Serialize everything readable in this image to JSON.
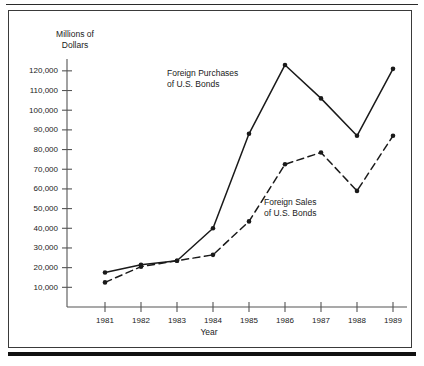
{
  "figure": {
    "y_axis_title_line1": "Millions of",
    "y_axis_title_line2": "Dollars",
    "x_axis_title": "Year",
    "annotations": {
      "purchases_line1": "Foreign Purchases",
      "purchases_line2": "of U.S. Bonds",
      "sales_line1": "Foreign Sales",
      "sales_line2": "of U.S. Bonds"
    },
    "colors": {
      "ink": "#1a1a1a",
      "axis": "#555555",
      "border": "#3a3a3a",
      "background": "#ffffff"
    }
  },
  "chart_data": {
    "type": "line",
    "title": "",
    "xlabel": "Year",
    "ylabel": "Millions of Dollars",
    "categories": [
      "1981",
      "1982",
      "1983",
      "1984",
      "1985",
      "1986",
      "1987",
      "1988",
      "1989"
    ],
    "x": [
      1981,
      1982,
      1983,
      1984,
      1985,
      1986,
      1987,
      1988,
      1989
    ],
    "ylim": [
      0,
      125000
    ],
    "yticks": [
      10000,
      20000,
      30000,
      40000,
      50000,
      60000,
      70000,
      80000,
      90000,
      100000,
      110000,
      120000
    ],
    "ytick_labels": [
      "10,000",
      "20,000",
      "30,000",
      "40,000",
      "50,000",
      "60,000",
      "70,000",
      "80,000",
      "90,000",
      "100,000",
      "110,000",
      "120,000"
    ],
    "grid": false,
    "legend_position": "inline-annotations",
    "series": [
      {
        "name": "Foreign Purchases of U.S. Bonds",
        "style": "solid",
        "marker": "filled-circle",
        "values": [
          17500,
          21500,
          23500,
          40000,
          88000,
          123000,
          106000,
          87000,
          121000
        ]
      },
      {
        "name": "Foreign Sales of U.S. Bonds",
        "style": "dashed",
        "marker": "filled-circle",
        "values": [
          12500,
          20500,
          23500,
          26500,
          43500,
          72500,
          78500,
          59000,
          87000
        ]
      }
    ]
  }
}
